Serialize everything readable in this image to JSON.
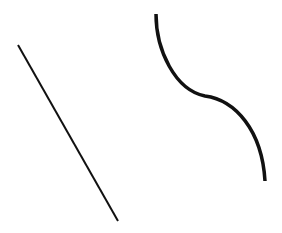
{
  "diagram": {
    "background": "#ffffff",
    "stroke_color": "#111111",
    "shapes": [
      {
        "id": "straight-line",
        "type": "line",
        "x1": 18,
        "y1": 45,
        "x2": 118,
        "y2": 221,
        "stroke_width": 2
      },
      {
        "id": "s-curve",
        "type": "path",
        "d": "M156,14 C156,50 175,90 205,96 C235,100 262,130 265,181",
        "stroke_width": 3.5
      }
    ]
  }
}
